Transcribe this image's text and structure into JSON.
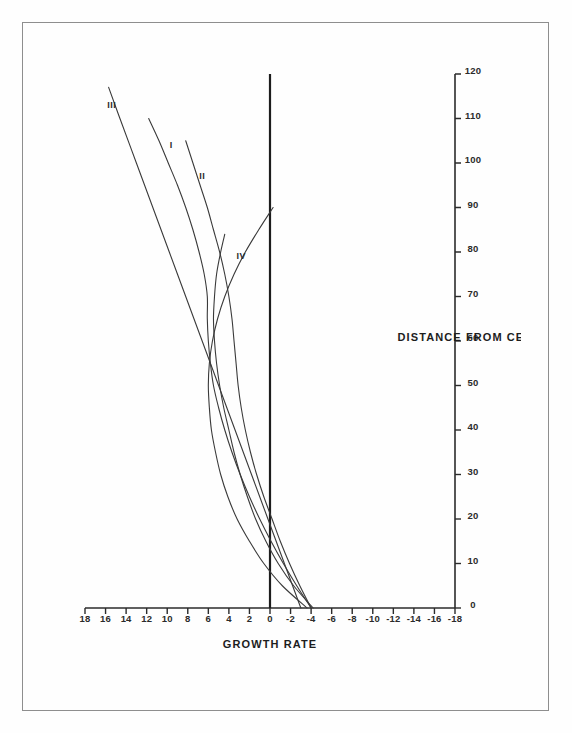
{
  "figure": {
    "orientation": "landscape-rotated",
    "background_color": "#ffffff",
    "line_color": "#3a3a3a",
    "axis_color": "#2b2b2b",
    "page_number": ""
  },
  "chart_data": {
    "type": "line",
    "title": "",
    "xlabel": "DISTANCE FROM CENTRAL CITY",
    "ylabel": "GROWTH RATE",
    "xlim": [
      0,
      120
    ],
    "ylim": [
      -18,
      18
    ],
    "xticks": [
      0,
      10,
      20,
      30,
      40,
      50,
      60,
      70,
      80,
      90,
      100,
      110,
      120
    ],
    "xticklabels": [
      "0",
      "10",
      "20",
      "30",
      "40",
      "50",
      "60",
      "70",
      "80",
      "90",
      "100",
      "110",
      "120"
    ],
    "yticks": [
      18,
      16,
      14,
      12,
      10,
      8,
      6,
      4,
      2,
      0,
      -2,
      -4,
      -6,
      -8,
      -10,
      -12,
      -14,
      -16,
      -18
    ],
    "yticklabels": [
      "18",
      "16",
      "14",
      "12",
      "10",
      "8",
      "6",
      "4",
      "2",
      "0",
      "-2",
      "-4",
      "-6",
      "-8",
      "-10",
      "-12",
      "-14",
      "-16",
      "-18"
    ],
    "grid": false,
    "legend_position": "inline-curve-labels",
    "zero_reference_line": 0,
    "series": [
      {
        "name": "I",
        "label": "I",
        "label_x": 104,
        "label_y": 9.6,
        "x": [
          0,
          5,
          10,
          15,
          20,
          25,
          30,
          35,
          40,
          45,
          50,
          55,
          60,
          65,
          70,
          75,
          80,
          85,
          90,
          95,
          100,
          105,
          110
        ],
        "y": [
          -4.0,
          -2.6,
          -1.3,
          -0.1,
          1.0,
          2.0,
          2.9,
          3.7,
          4.4,
          5.0,
          5.5,
          5.8,
          6.0,
          6.1,
          6.1,
          6.4,
          6.9,
          7.5,
          8.2,
          9.0,
          9.9,
          10.8,
          11.8
        ]
      },
      {
        "name": "II",
        "label": "II",
        "label_x": 97,
        "label_y": 6.6,
        "x": [
          0,
          5,
          10,
          15,
          20,
          25,
          30,
          35,
          40,
          45,
          50,
          55,
          60,
          65,
          70,
          75,
          80,
          85,
          90,
          95,
          100,
          105
        ],
        "y": [
          -4.0,
          -2.9,
          -1.9,
          -1.0,
          -0.2,
          0.6,
          1.3,
          1.9,
          2.4,
          2.8,
          3.1,
          3.3,
          3.5,
          3.7,
          4.0,
          4.4,
          4.9,
          5.5,
          6.1,
          6.8,
          7.5,
          8.2
        ]
      },
      {
        "name": "III",
        "label": "III",
        "label_x": 113,
        "label_y": 15.4,
        "x": [
          0,
          10,
          20,
          30,
          40,
          50,
          60,
          70,
          80,
          90,
          100,
          110,
          117
        ],
        "y": [
          -3.0,
          -1.4,
          0.2,
          1.8,
          3.4,
          5.0,
          6.6,
          8.2,
          9.8,
          11.4,
          13.0,
          14.6,
          15.7
        ]
      },
      {
        "name": "IV",
        "label": "IV",
        "label_x": 79,
        "label_y": 2.8,
        "x": [
          0,
          5,
          10,
          15,
          20,
          25,
          30,
          35,
          40,
          45,
          50,
          55,
          60,
          65,
          70,
          75,
          80,
          84
        ],
        "y": [
          -4.2,
          -2.3,
          -0.8,
          0.4,
          1.4,
          2.2,
          2.9,
          3.5,
          4.0,
          4.5,
          4.9,
          5.2,
          5.4,
          5.5,
          5.4,
          5.2,
          4.8,
          4.4
        ]
      },
      {
        "name": "V",
        "label": "",
        "label_x": 0,
        "label_y": 0,
        "x": [
          0,
          5,
          10,
          15,
          20,
          25,
          30,
          35,
          40,
          45,
          50,
          55,
          60,
          65,
          70,
          75,
          80,
          85,
          90
        ],
        "y": [
          -3.6,
          -1.2,
          0.6,
          2.0,
          3.2,
          4.1,
          4.8,
          5.3,
          5.7,
          5.9,
          6.0,
          5.9,
          5.6,
          5.1,
          4.4,
          3.5,
          2.4,
          1.1,
          -0.3
        ]
      }
    ]
  }
}
